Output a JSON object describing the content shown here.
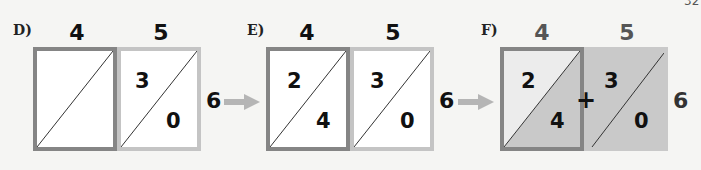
{
  "corner_mark": "32",
  "panels": [
    {
      "label": "D)",
      "columns": [
        "4",
        "5"
      ],
      "cells": [
        {
          "top": "",
          "bottom": ""
        },
        {
          "top": "3",
          "bottom": "0"
        }
      ],
      "row_label": "6"
    },
    {
      "label": "E)",
      "columns": [
        "4",
        "5"
      ],
      "cells": [
        {
          "top": "2",
          "bottom": "4"
        },
        {
          "top": "3",
          "bottom": "0"
        }
      ],
      "row_label": "6"
    },
    {
      "label": "F)",
      "columns": [
        "4",
        "5"
      ],
      "cells": [
        {
          "top": "2",
          "bottom": "4"
        },
        {
          "top": "3",
          "bottom": "0"
        }
      ],
      "row_label": "6",
      "operator": "+"
    }
  ],
  "colors": {
    "dark_border": "#858585",
    "light_border": "#c4c4c4",
    "shade": "#c9c9c9",
    "arrow": "#b5b5b5"
  }
}
